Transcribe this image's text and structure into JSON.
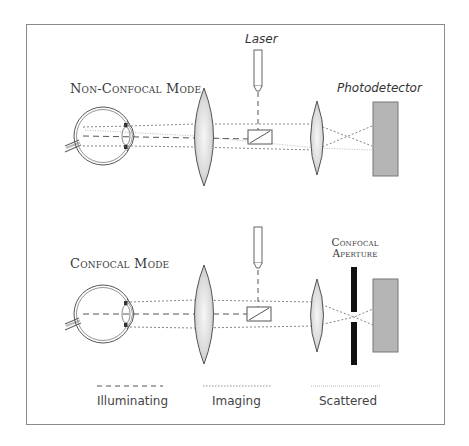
{
  "figure": {
    "background": "#ffffff",
    "frame_color": "#8a8a8a"
  },
  "top_panel": {
    "title": "Non-Confocal Mode",
    "laser_label": "Laser",
    "detector_label": "Photodetector"
  },
  "bottom_panel": {
    "title": "Confocal Mode",
    "aperture_label_line1": "Confocal",
    "aperture_label_line2": "Aperture"
  },
  "legend": {
    "items": [
      {
        "label": "Illuminating",
        "style": "dashed"
      },
      {
        "label": "Imaging",
        "style": "dotted"
      },
      {
        "label": "Scattered",
        "style": "fine-dotted"
      }
    ]
  },
  "colors": {
    "lens_fill_center": "#f4f4f4",
    "lens_fill_edge": "#bdbdbd",
    "detector_fill": "#b5b5b5",
    "aperture_fill": "#111111",
    "line_color": "#555555"
  }
}
